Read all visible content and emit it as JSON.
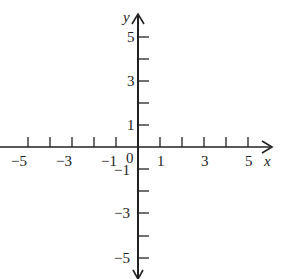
{
  "diagram": {
    "type": "coordinate-axes",
    "x_axis": {
      "label": "x",
      "range": [
        -5,
        5
      ],
      "ticks": [
        -5,
        -4,
        -3,
        -2,
        -1,
        1,
        2,
        3,
        4,
        5
      ],
      "labeled_ticks": [
        "-5",
        "-3",
        "-1",
        "1",
        "3",
        "5"
      ]
    },
    "y_axis": {
      "label": "y",
      "range": [
        -5,
        5
      ],
      "ticks": [
        -5,
        -4,
        -3,
        -2,
        -1,
        1,
        2,
        3,
        4,
        5
      ],
      "labeled_ticks": [
        "5",
        "3",
        "1",
        "-1",
        "-3",
        "-5"
      ]
    },
    "origin_label": "0",
    "colors": {
      "axis": "#222222",
      "background": "#ffffff"
    }
  },
  "labels": {
    "x": "x",
    "y": "y",
    "origin": "0",
    "xm5": "−5",
    "xm3": "−3",
    "xm1": "−1",
    "x1": "1",
    "x3": "3",
    "x5": "5",
    "y5": "5",
    "y3": "3",
    "y1": "1",
    "ym1": "−1",
    "ym3": "−3",
    "ym5": "−5"
  }
}
